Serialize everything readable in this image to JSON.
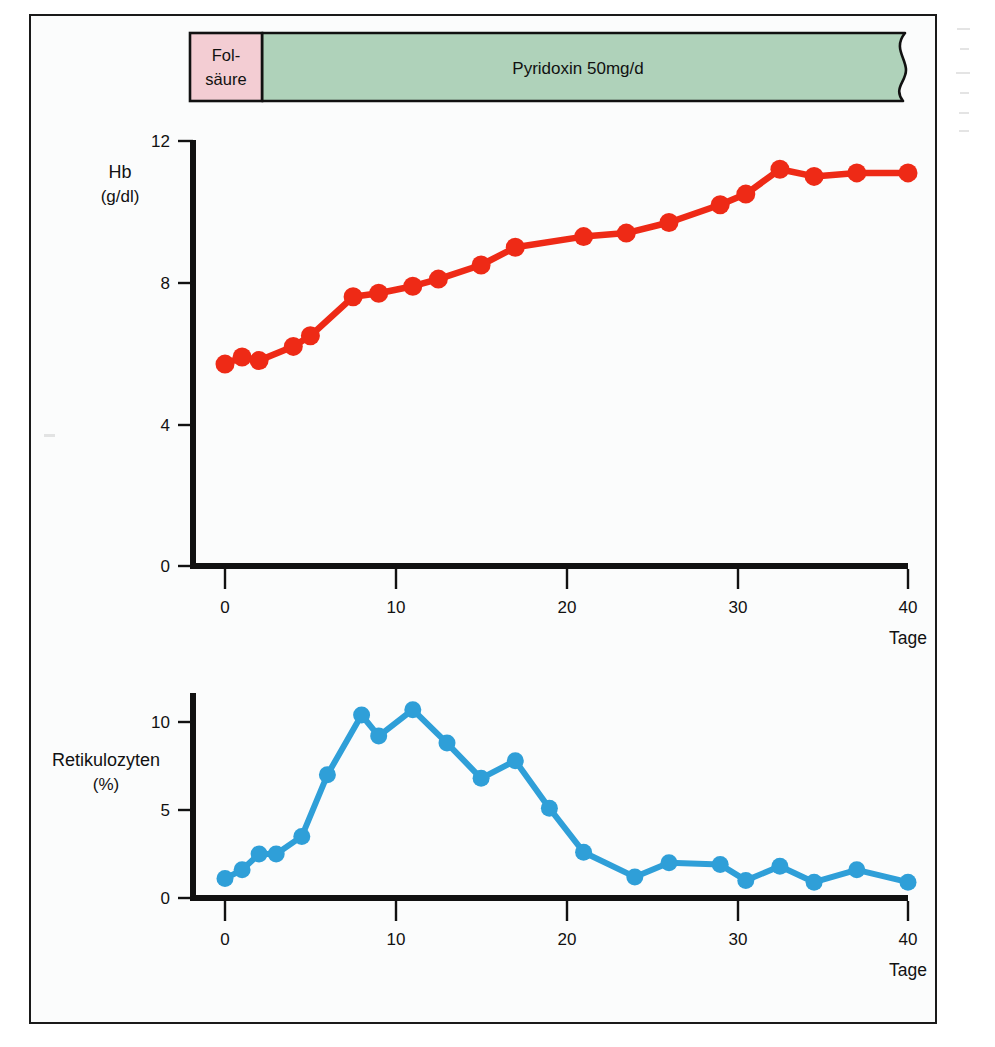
{
  "figure": {
    "treatment_bar": {
      "segments": [
        {
          "name": "folic-acid",
          "label": "Fol-\nsäure",
          "label_line1": "Fol-",
          "label_line2": "säure",
          "color": "#f3cdd3",
          "start_day": -2.6,
          "end_day": 2.0
        },
        {
          "name": "pyridoxine",
          "label": "Pyridoxin 50mg/d",
          "color": "#afd2ba",
          "start_day": 2.0,
          "end_day": 43.0,
          "continues": true
        }
      ]
    },
    "panels": [
      {
        "name": "hemoglobin-panel",
        "y_axis_label": "Hb",
        "y_axis_unit": "(g/dl)",
        "y_ticks": [
          "0",
          "4",
          "8",
          "12"
        ],
        "x_ticks": [
          "0",
          "10",
          "20",
          "30",
          "40"
        ],
        "x_axis_label": "Tage"
      },
      {
        "name": "reticulocyte-panel",
        "y_axis_label": "Retikulozyten",
        "y_axis_unit": "(%)",
        "y_ticks": [
          "0",
          "5",
          "10"
        ],
        "x_ticks": [
          "0",
          "10",
          "20",
          "30",
          "40"
        ],
        "x_axis_label": "Tage"
      }
    ],
    "colors": {
      "hb_line": "#ee2a16",
      "retic_line": "#2f9fd8",
      "folic_acid": "#f3cdd3",
      "pyridoxine": "#afd2ba",
      "axis": "#111111",
      "frame": "#1a1a1a",
      "panel_bg": "#fbfcfc"
    }
  },
  "chart_data": [
    {
      "type": "line",
      "name": "hemoglobin",
      "title": "Hb (g/dl) über Tage",
      "xlabel": "Tage",
      "ylabel": "Hb (g/dl)",
      "xlim": [
        -2,
        41
      ],
      "ylim": [
        0,
        12
      ],
      "grid": false,
      "legend": "none",
      "color": "#ee2a16",
      "x": [
        0,
        1,
        2,
        4,
        5,
        7.5,
        9,
        11,
        12.5,
        15,
        17,
        21,
        23.5,
        26,
        29,
        30.5,
        32.5,
        34.5,
        37,
        40
      ],
      "y": [
        5.7,
        5.9,
        5.8,
        6.2,
        6.5,
        7.6,
        7.7,
        7.9,
        8.1,
        8.5,
        9.0,
        9.3,
        9.4,
        9.7,
        10.2,
        10.5,
        11.2,
        11.0,
        11.1,
        11.1
      ]
    },
    {
      "type": "line",
      "name": "reticulocytes",
      "title": "Retikulozyten (%) über Tage",
      "xlabel": "Tage",
      "ylabel": "Retikulozyten (%)",
      "xlim": [
        -2,
        41
      ],
      "ylim": [
        0,
        12
      ],
      "grid": false,
      "legend": "none",
      "color": "#2f9fd8",
      "x": [
        0,
        1,
        2,
        3,
        4.5,
        6,
        8,
        9,
        11,
        13,
        15,
        17,
        19,
        21,
        24,
        26,
        29,
        30.5,
        32.5,
        34.5,
        37,
        40
      ],
      "y": [
        1.1,
        1.6,
        2.5,
        2.5,
        3.5,
        7.0,
        10.4,
        9.2,
        10.7,
        8.8,
        6.8,
        7.8,
        5.1,
        2.6,
        1.2,
        2.0,
        1.9,
        1.0,
        1.8,
        0.9,
        1.6,
        0.9
      ]
    }
  ]
}
